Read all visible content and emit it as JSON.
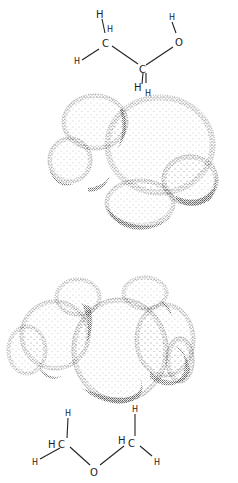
{
  "figure": {
    "top_molecule": {
      "name": "ethanol",
      "formula_atoms": {
        "h1": "H",
        "h2": "H",
        "h3": "H",
        "c1": "C",
        "c2": "C",
        "h4": "H",
        "h5": "H",
        "o": "O",
        "h_o": "H"
      }
    },
    "bottom_molecule": {
      "name": "dimethyl ether",
      "formula_atoms": {
        "h_top_left": "H",
        "h_left": "H",
        "c_left": "C",
        "h_bottom_left": "H",
        "o": "O",
        "h_top_right": "H",
        "h_right": "H",
        "c_right": "C",
        "h_bottom_right": "H"
      }
    },
    "colors": {
      "ink": "#222222",
      "background": "#ffffff"
    }
  }
}
